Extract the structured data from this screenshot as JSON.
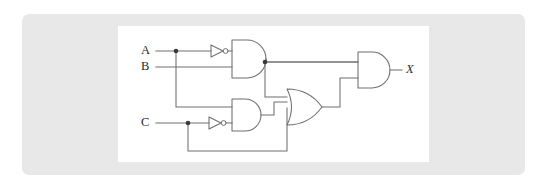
{
  "figure": {
    "kind": "logic-circuit-diagram",
    "title": "",
    "background_color": "#ffffff",
    "panel_color": "#e8e8e8",
    "canvas_color": "#ffffff",
    "wire_color": "#6f6f6f",
    "label_color": "#2b2b2b",
    "junction_color": "#3a3a3a"
  },
  "inputs": [
    {
      "id": "A",
      "label": "A",
      "x": 143,
      "y": 47
    },
    {
      "id": "B",
      "label": "B",
      "x": 143,
      "y": 67
    },
    {
      "id": "C",
      "label": "C",
      "x": 143,
      "y": 123
    }
  ],
  "outputs": [
    {
      "id": "X",
      "label": "X",
      "x": 406,
      "y": 70
    }
  ],
  "gates": [
    {
      "id": "inv1",
      "type": "NOT",
      "label": "NOT",
      "inputs": [
        "A"
      ],
      "output": "notA"
    },
    {
      "id": "inv2",
      "type": "NOT",
      "label": "NOT",
      "inputs": [
        "C"
      ],
      "output": "notC"
    },
    {
      "id": "and1",
      "type": "AND",
      "label": "AND",
      "inputs": [
        "notA",
        "B"
      ],
      "output": "n1"
    },
    {
      "id": "and2",
      "type": "AND",
      "label": "AND",
      "inputs": [
        "A",
        "notC"
      ],
      "output": "n2"
    },
    {
      "id": "or1",
      "type": "OR",
      "label": "OR",
      "inputs": [
        "n1",
        "n2",
        "C"
      ],
      "output": "n3"
    },
    {
      "id": "and3",
      "type": "AND",
      "label": "AND",
      "inputs": [
        "n1",
        "n3"
      ],
      "output": "X"
    }
  ],
  "junctions": [
    {
      "id": "j-a",
      "on": "A",
      "x": 176,
      "y": 51
    },
    {
      "id": "j-n1",
      "on": "n1",
      "x": 265,
      "y": 62
    },
    {
      "id": "j-c",
      "on": "C",
      "x": 188,
      "y": 123
    }
  ],
  "expression": "X = (A'B)((AC') + (A'B) + C)"
}
